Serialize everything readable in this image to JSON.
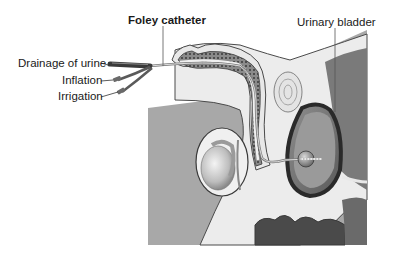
{
  "diagram": {
    "type": "anatomical-illustration",
    "labels": {
      "foley_catheter": "Foley catheter",
      "urinary_bladder": "Urinary bladder",
      "drainage_of_urine": "Drainage of urine",
      "inflation": "Inflation",
      "irrigation": "Irrigation"
    },
    "colors": {
      "background": "#ffffff",
      "body_gray": "#a8a8a8",
      "tissue_light": "#ececec",
      "tissue_mid": "#cfcfcf",
      "dark_tissue": "#3c3c3c",
      "outline": "#4a4a4a",
      "catheter": "#7a7a7a"
    }
  }
}
